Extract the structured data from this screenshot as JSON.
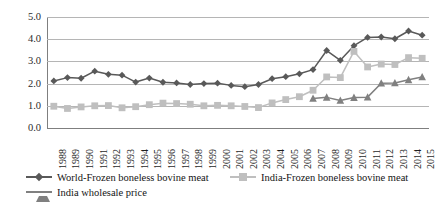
{
  "chart_data": {
    "type": "line",
    "title": "",
    "subtitle": "",
    "xlabel": "",
    "ylabel": "",
    "ylim": [
      0.0,
      5.0
    ],
    "yticks": [
      "0.0",
      "1.0",
      "2.0",
      "3.0",
      "4.0",
      "5.0"
    ],
    "ytick_values": [
      0.0,
      1.0,
      2.0,
      3.0,
      4.0,
      5.0
    ],
    "grid": true,
    "legend_position": "bottom",
    "categories": [
      "1988",
      "1989",
      "1990",
      "1991",
      "1992",
      "1993",
      "1994",
      "1995",
      "1996",
      "1997",
      "1998",
      "1999",
      "2000",
      "2001",
      "2002",
      "2003",
      "2004",
      "2005",
      "2006",
      "2007",
      "2008",
      "2009",
      "2010",
      "2011",
      "2012",
      "2013",
      "2014",
      "2015"
    ],
    "series": [
      {
        "name": "World-Frozen boneless bovine meat",
        "color": "#595959",
        "marker": "diamond",
        "values": [
          2.12,
          2.27,
          2.24,
          2.56,
          2.42,
          2.38,
          2.07,
          2.25,
          2.06,
          2.03,
          1.96,
          2.0,
          2.02,
          1.92,
          1.86,
          1.96,
          2.22,
          2.31,
          2.44,
          2.63,
          3.49,
          3.05,
          3.71,
          4.08,
          4.1,
          4.02,
          4.37,
          4.18
        ]
      },
      {
        "name": "India-Frozen boneless bovine meat",
        "color": "#bfbfbf",
        "marker": "square",
        "values": [
          0.98,
          0.88,
          0.95,
          1.0,
          1.01,
          0.91,
          0.96,
          1.05,
          1.12,
          1.1,
          1.07,
          1.0,
          1.02,
          1.0,
          0.97,
          0.92,
          1.13,
          1.28,
          1.41,
          1.7,
          2.3,
          2.27,
          3.45,
          2.75,
          2.88,
          2.86,
          3.17,
          3.14
        ]
      },
      {
        "name": "India wholesale price",
        "color": "#808080",
        "marker": "triangle",
        "values": [
          null,
          null,
          null,
          null,
          null,
          null,
          null,
          null,
          null,
          null,
          null,
          null,
          null,
          null,
          null,
          null,
          null,
          null,
          null,
          1.33,
          1.38,
          1.24,
          1.37,
          1.39,
          2.02,
          2.03,
          2.17,
          2.3
        ]
      }
    ]
  },
  "legend": {
    "items": [
      {
        "label": "World-Frozen boneless bovine meat"
      },
      {
        "label": "India-Frozen boneless bovine meat"
      },
      {
        "label": "India wholesale price"
      }
    ]
  }
}
